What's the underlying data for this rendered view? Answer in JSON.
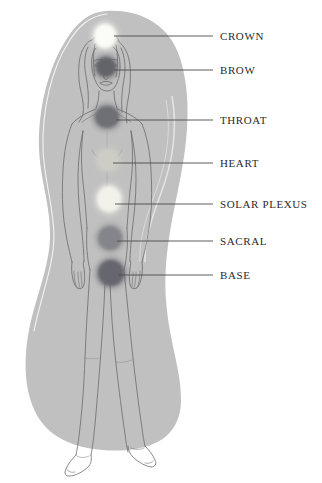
{
  "diagram": {
    "background_color": "#ffffff",
    "aura_color": "#c0c0c0",
    "aura_outline_color": "#ffffff",
    "body_outline_color": "#6b6b6b",
    "leader_line_color": "#4a4a4a",
    "label_color": "#2b2b2b"
  },
  "chakras": [
    {
      "id": "crown",
      "label": "CROWN",
      "dot_color": "#fbfbf7",
      "dot_cx": 105,
      "dot_cy": 36,
      "dot_rx": 11,
      "dot_ry": 12,
      "line_x1": 114,
      "line_x2": 213,
      "line_y": 36,
      "label_x": 220,
      "label_y": 36
    },
    {
      "id": "brow",
      "label": "BROW",
      "dot_color": "#63636b",
      "dot_cx": 106,
      "dot_cy": 67,
      "dot_rx": 10,
      "dot_ry": 10,
      "line_x1": 114,
      "line_x2": 213,
      "line_y": 70,
      "label_x": 220,
      "label_y": 70
    },
    {
      "id": "throat",
      "label": "THROAT",
      "dot_color": "#6e7076",
      "dot_cx": 107,
      "dot_cy": 117,
      "dot_rx": 12,
      "dot_ry": 11,
      "line_x1": 116,
      "line_x2": 213,
      "line_y": 120,
      "label_x": 220,
      "label_y": 120
    },
    {
      "id": "heart",
      "label": "HEART",
      "dot_color": "#cdcdc6",
      "dot_cx": 108,
      "dot_cy": 160,
      "dot_rx": 11,
      "dot_ry": 11,
      "line_x1": 113,
      "line_x2": 213,
      "line_y": 163,
      "label_x": 220,
      "label_y": 163
    },
    {
      "id": "solar-plexus",
      "label": "SOLAR PLEXUS",
      "dot_color": "#f2f1ea",
      "dot_cx": 109,
      "dot_cy": 199,
      "dot_rx": 12,
      "dot_ry": 13,
      "line_x1": 115,
      "line_x2": 213,
      "line_y": 204,
      "label_x": 220,
      "label_y": 204
    },
    {
      "id": "sacral",
      "label": "SACRAL",
      "dot_color": "#84858a",
      "dot_cx": 110,
      "dot_cy": 238,
      "dot_rx": 12,
      "dot_ry": 12,
      "line_x1": 117,
      "line_x2": 213,
      "line_y": 241,
      "label_x": 220,
      "label_y": 241
    },
    {
      "id": "base",
      "label": "BASE",
      "dot_color": "#66666e",
      "dot_cx": 111,
      "dot_cy": 273,
      "dot_rx": 13,
      "dot_ry": 13,
      "line_x1": 119,
      "line_x2": 213,
      "line_y": 275,
      "label_x": 220,
      "label_y": 275
    }
  ]
}
